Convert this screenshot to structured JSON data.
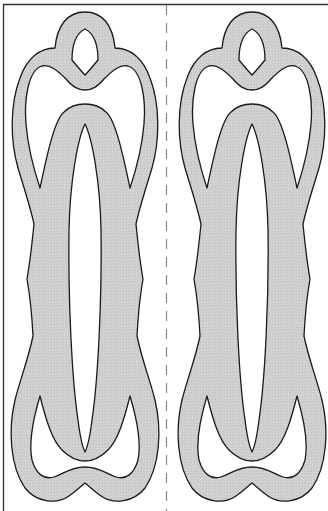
{
  "diagram": {
    "type": "template-pattern",
    "description": "Two identical symmetric looped shapes separated by a dashed fold line",
    "colors": {
      "fill": "#cfcfcf",
      "stroke": "#1a1a1a",
      "frame": "#333333",
      "fold_line": "#8a8a8a",
      "background": "#ffffff"
    },
    "pieces": [
      {
        "id": "left-piece",
        "center_x": 85
      },
      {
        "id": "right-piece",
        "center_x": 252
      }
    ],
    "fold_line": {
      "x": 166,
      "style": "dashed"
    }
  }
}
